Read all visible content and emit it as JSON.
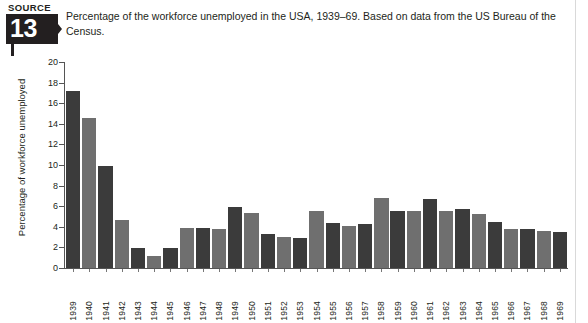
{
  "header": {
    "source_word": "SOURCE",
    "source_number": "13",
    "caption": "Percentage of the workforce unemployed in the USA, 1939–69. Based on data from the US Bureau of the Census."
  },
  "colors": {
    "bar_dark": "#3b3b3b",
    "bar_light": "#6f6f6f",
    "axis": "#555555",
    "text": "#231f20"
  },
  "chart_data": {
    "type": "bar",
    "title": "",
    "xlabel": "",
    "ylabel": "Percentage of workforce unemployed",
    "ylim": [
      0,
      20
    ],
    "yticks": [
      0,
      2,
      4,
      6,
      8,
      10,
      12,
      14,
      16,
      18,
      20
    ],
    "grid": false,
    "legend": "none",
    "categories": [
      "1939",
      "1940",
      "1941",
      "1942",
      "1943",
      "1944",
      "1945",
      "1946",
      "1947",
      "1948",
      "1949",
      "1950",
      "1951",
      "1952",
      "1953",
      "1954",
      "1955",
      "1956",
      "1957",
      "1958",
      "1959",
      "1960",
      "1961",
      "1962",
      "1963",
      "1964",
      "1965",
      "1966",
      "1967",
      "1968",
      "1969"
    ],
    "values": [
      17.2,
      14.6,
      9.9,
      4.7,
      1.9,
      1.2,
      1.9,
      3.9,
      3.9,
      3.8,
      5.9,
      5.3,
      3.3,
      3.0,
      2.9,
      5.5,
      4.4,
      4.1,
      4.3,
      6.8,
      5.5,
      5.5,
      6.7,
      5.5,
      5.7,
      5.2,
      4.5,
      3.8,
      3.8,
      3.6,
      3.5
    ],
    "bar_colors": [
      "dark",
      "light",
      "dark",
      "light",
      "dark",
      "light",
      "dark",
      "light",
      "dark",
      "light",
      "dark",
      "light",
      "dark",
      "light",
      "dark",
      "light",
      "dark",
      "light",
      "dark",
      "light",
      "dark",
      "light",
      "dark",
      "light",
      "dark",
      "light",
      "dark",
      "light",
      "dark",
      "light",
      "dark"
    ]
  }
}
